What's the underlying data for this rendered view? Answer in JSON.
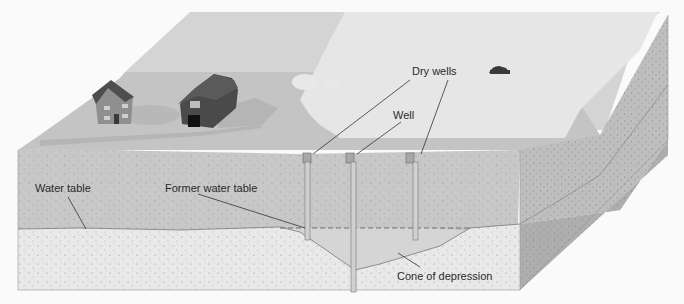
{
  "diagram": {
    "type": "groundwater-well-cross-section",
    "labels": {
      "dry_wells": "Dry wells",
      "well": "Well",
      "water_table": "Water table",
      "former_water_table": "Former water table",
      "cone_of_depression": "Cone of depression"
    },
    "elements": [
      "house",
      "barn",
      "trees",
      "car",
      "three-wells",
      "soil-layers",
      "aquifer"
    ],
    "colors": {
      "background": "#fafafa",
      "far_field": "#d4d4d4",
      "near_ground": "#c2c2c2",
      "light_field": "#e6e6e6",
      "unsaturated_zone": "#c9c9c9",
      "saturated_zone": "#e9e9e9",
      "cone_zone": "#bdbdbd",
      "right_face_top": "#bebebe",
      "right_face_bottom": "#aeaeae",
      "leader_line": "#333333",
      "barn": "#4a4a4a",
      "house": "#8c8c8c"
    }
  }
}
